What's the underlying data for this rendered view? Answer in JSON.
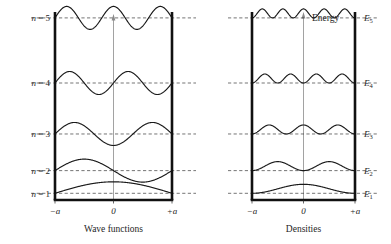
{
  "figure": {
    "title": "",
    "panels": [
      {
        "id": "wave-functions",
        "caption": "Wave functions",
        "axis_labels": {
          "left": "−a",
          "center": "0",
          "right": "+a"
        },
        "level_labels": [
          "n = 1",
          "n = 2",
          "n = 3",
          "n = 4",
          "n = 5"
        ],
        "energy_axis_label": ""
      },
      {
        "id": "densities",
        "caption": "Densities",
        "axis_labels": {
          "left": "−a",
          "center": "0",
          "right": "+a"
        },
        "level_labels": [
          "E",
          "E",
          "E",
          "E",
          "E"
        ],
        "level_subscripts": [
          "1",
          "2",
          "3",
          "4",
          "5"
        ],
        "energy_axis_label": "Energy"
      }
    ]
  },
  "chart_data": {
    "type": "line",
    "xlabel": "",
    "ylabel": "Energy",
    "x_ticks": [
      "−a",
      "0",
      "+a"
    ],
    "x_tick_values": [
      -1,
      0,
      1
    ],
    "xlim": [
      -1,
      1
    ],
    "grid": false,
    "legend_position": "none",
    "well_walls": {
      "left": "−a",
      "right": "+a"
    },
    "levels": [
      {
        "n": 1,
        "label_left": "n = 1",
        "label_right": "E",
        "subscript": "1",
        "energy_relative": 1,
        "baseline_y_frac": 0.964,
        "nodes_interior": 0,
        "antinodes": 1
      },
      {
        "n": 2,
        "label_left": "n = 2",
        "label_right": "E",
        "subscript": "2",
        "energy_relative": 4,
        "baseline_y_frac": 0.842,
        "nodes_interior": 1,
        "antinodes": 2
      },
      {
        "n": 3,
        "label_left": "n = 3",
        "label_right": "E",
        "subscript": "3",
        "energy_relative": 9,
        "baseline_y_frac": 0.645,
        "nodes_interior": 2,
        "antinodes": 3
      },
      {
        "n": 4,
        "label_left": "n = 4",
        "label_right": "E",
        "subscript": "4",
        "energy_relative": 16,
        "baseline_y_frac": 0.371,
        "nodes_interior": 3,
        "antinodes": 4
      },
      {
        "n": 5,
        "label_left": "n = 5",
        "label_right": "E",
        "subscript": "5",
        "energy_relative": 25,
        "baseline_y_frac": 0.021,
        "nodes_interior": 4,
        "antinodes": 5
      }
    ],
    "left_panel": {
      "curve_type": "psi",
      "description": "sine wave functions, n half-wavelengths across the well"
    },
    "right_panel": {
      "curve_type": "psi_squared",
      "description": "probability densities, n positive humps across the well"
    },
    "colors": {
      "wall": "#111111",
      "curve": "#1a1a1a",
      "dashed_level": "#3a3a3a",
      "axis": "#8a8a8a",
      "text": "#262626",
      "background": "#ffffff"
    }
  }
}
